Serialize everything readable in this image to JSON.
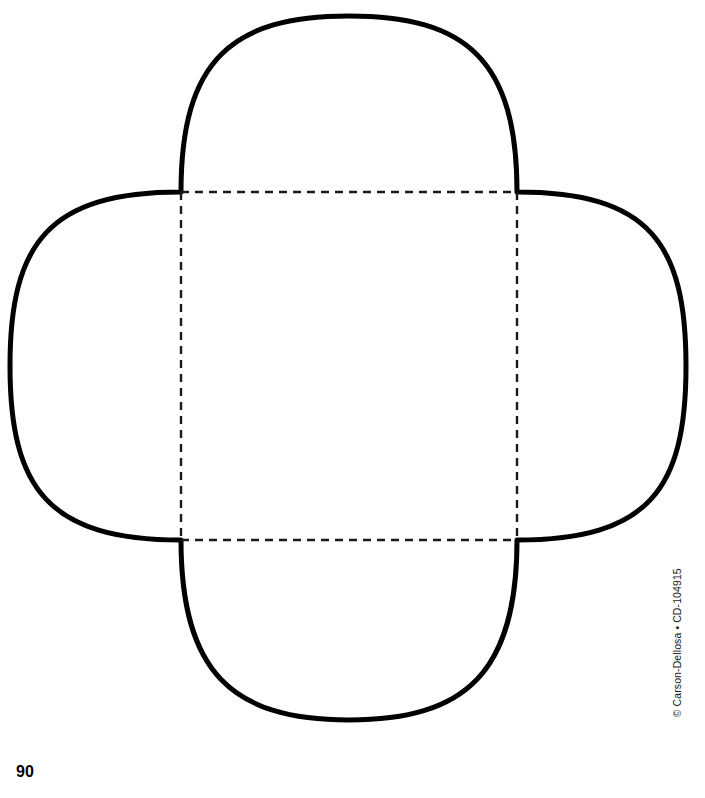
{
  "page": {
    "width": 705,
    "height": 798,
    "background_color": "#ffffff",
    "page_number": "90"
  },
  "footer": {
    "copyright_text": "© Carson-Dellosa • CD-104915"
  },
  "template": {
    "name": "quatrefoil-box-template",
    "description": "Four-petal box / envelope cut-out template with dashed fold lines",
    "stroke_color": "#000000",
    "stroke_width": 5,
    "fill_color": "#ffffff",
    "fold_line": {
      "name": "dashed-square-fold-lines",
      "stroke_color": "#1a1a1a",
      "stroke_width": 2.4,
      "dash": "8 6",
      "left": 181,
      "top": 192,
      "right": 517,
      "bottom": 540,
      "width": 336,
      "height": 348
    },
    "petals": [
      {
        "name": "top-petal",
        "apex_x": 349,
        "apex_y": 16,
        "base_from": 181,
        "base_to": 517
      },
      {
        "name": "right-petal",
        "apex_x": 686,
        "apex_y": 366,
        "base_from": 192,
        "base_to": 540
      },
      {
        "name": "bottom-petal",
        "apex_x": 349,
        "apex_y": 720,
        "base_from": 181,
        "base_to": 517
      },
      {
        "name": "left-petal",
        "apex_x": 10,
        "apex_y": 366,
        "base_from": 192,
        "base_to": 540
      }
    ],
    "outline_path": "M 181 192 C 181 60 232 16 349 16 C 466 16 517 60 517 192 C 649 192 686 243 686 366 C 686 489 649 540 517 540 C 517 672 466 720 349 720 C 232 720 181 672 181 540 C 49 540 10 489 10 366 C 10 243 49 192 181 192 Z"
  }
}
